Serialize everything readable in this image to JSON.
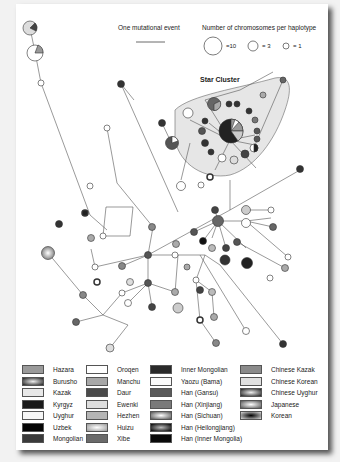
{
  "header": {
    "scale_label": "One mutational event",
    "size_key_title": "Number of chromosomes per haplotype",
    "size_key": [
      {
        "label": "=10",
        "radius": 9
      },
      {
        "label": "= 3",
        "radius": 5
      },
      {
        "label": "= 1",
        "radius": 3
      }
    ]
  },
  "network": {
    "cluster_label": "Star Cluster"
  },
  "legend": {
    "columns": [
      [
        {
          "label": "Hazara",
          "color": "#9a9a9a"
        },
        {
          "label": "Burusho",
          "color": "gradient-dark"
        },
        {
          "label": "Kazak",
          "color": "#e8e8e8"
        },
        {
          "label": "Kyrgyz",
          "color": "#1a1a1a"
        },
        {
          "label": "Uyghur",
          "color": "#f6f6f6"
        },
        {
          "label": "Uzbek",
          "color": "#050505"
        },
        {
          "label": "Mongolian",
          "color": "#3a3a3a"
        }
      ],
      [
        {
          "label": "Oroqen",
          "color": "#ffffff"
        },
        {
          "label": "Manchu",
          "color": "#a8a8a8"
        },
        {
          "label": "Daur",
          "color": "#4a4a4a"
        },
        {
          "label": "Ewenki",
          "color": "#dedede"
        },
        {
          "label": "Hezhen",
          "color": "#b5b5b5"
        },
        {
          "label": "Huizu",
          "color": "gradient-light"
        },
        {
          "label": "Xibe",
          "color": "#6a6a6a"
        }
      ],
      [
        {
          "label": "Inner Mongolian",
          "color": "#2a2a2a"
        },
        {
          "label": "Yaozu (Bama)",
          "color": "#fbfbfb"
        },
        {
          "label": "Han (Gansu)",
          "color": "#5a5a5a"
        },
        {
          "label": "Han (Xinjiang)",
          "color": "#7a7a7a"
        },
        {
          "label": "Han (Sichuan)",
          "color": "gradient-mid"
        },
        {
          "label": "Han (Heilongjiang)",
          "color": "gradient-black"
        },
        {
          "label": "Han (Inner Mongolia)",
          "color": "#0a0a0a"
        }
      ],
      [
        {
          "label": "Chinese Kazak",
          "color": "#8a8a8a"
        },
        {
          "label": "Chinese Korean",
          "color": "#e0e0e0"
        },
        {
          "label": "Chinese Uyghur",
          "color": "gradient-dark"
        },
        {
          "label": "Japanese",
          "color": "gradient-mid"
        },
        {
          "label": "Korean",
          "color": "gradient-black"
        }
      ]
    ]
  }
}
